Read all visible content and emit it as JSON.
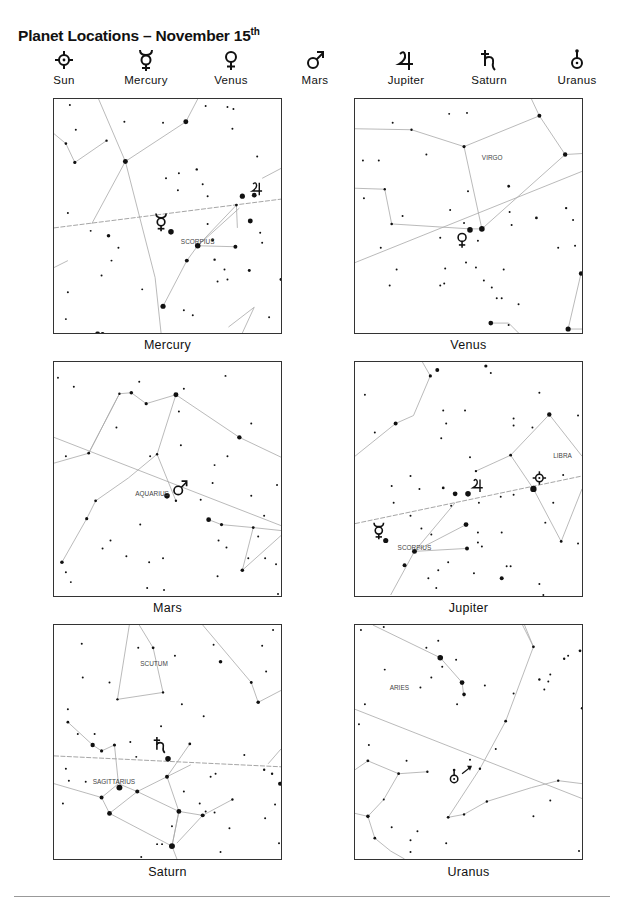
{
  "title": {
    "text": "Planet Locations – November 15",
    "superscript": "th"
  },
  "legend": [
    {
      "name": "Sun",
      "icon": "sun-icon"
    },
    {
      "name": "Mercury",
      "icon": "mercury-icon"
    },
    {
      "name": "Venus",
      "icon": "venus-icon"
    },
    {
      "name": "Mars",
      "icon": "mars-icon"
    },
    {
      "name": "Jupiter",
      "icon": "jupiter-icon"
    },
    {
      "name": "Saturn",
      "icon": "saturn-icon"
    },
    {
      "name": "Uranus",
      "icon": "uranus-icon"
    }
  ],
  "panels": [
    {
      "caption": "Mercury",
      "constellations": [
        "SCORPIUS"
      ],
      "planets_shown": [
        "Mercury",
        "Jupiter"
      ]
    },
    {
      "caption": "Venus",
      "constellations": [
        "VIRGO"
      ],
      "planets_shown": [
        "Venus"
      ]
    },
    {
      "caption": "Mars",
      "constellations": [
        "AQUARIUS"
      ],
      "planets_shown": [
        "Mars"
      ]
    },
    {
      "caption": "Jupiter",
      "constellations": [
        "LIBRA",
        "SCORPIUS"
      ],
      "planets_shown": [
        "Jupiter",
        "Sun",
        "Mercury"
      ]
    },
    {
      "caption": "Saturn",
      "constellations": [
        "SCUTUM",
        "SAGITTARIUS"
      ],
      "planets_shown": [
        "Saturn"
      ]
    },
    {
      "caption": "Uranus",
      "constellations": [
        "ARIES"
      ],
      "planets_shown": [
        "Uranus"
      ]
    }
  ]
}
